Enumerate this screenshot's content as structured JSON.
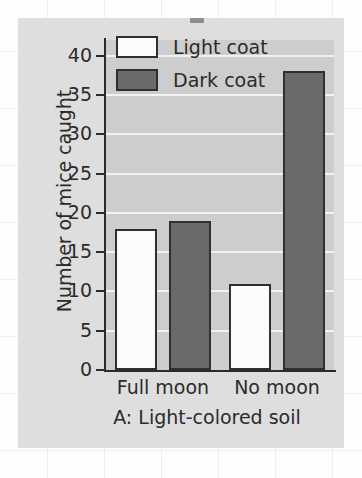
{
  "chart_data": {
    "type": "bar",
    "title": "",
    "subtitle": "",
    "caption": "A: Light-colored soil",
    "xlabel": "",
    "ylabel": "Number of mice caught",
    "categories": [
      "Full moon",
      "No moon"
    ],
    "series": [
      {
        "name": "Light coat",
        "values": [
          18,
          11
        ],
        "color": "#fbfbfb"
      },
      {
        "name": "Dark coat",
        "values": [
          19,
          38
        ],
        "color": "#6a6a6a"
      }
    ],
    "ylim": [
      0,
      42
    ],
    "yticks": [
      0,
      5,
      10,
      15,
      20,
      25,
      30,
      35,
      40
    ],
    "ytick_labels": [
      "0",
      "5",
      "10",
      "15",
      "20",
      "25",
      "30",
      "35",
      "40"
    ],
    "grid": "horizontal",
    "legend_position": "top-left-inside",
    "plot_background": "#cdcdcd",
    "gridline_color": "#f2f2f2",
    "axis_color": "#2b2b2b",
    "panel_background": "#dedede",
    "page_background": "#fdfdfd"
  },
  "legend": {
    "items": [
      {
        "label": "Light coat",
        "swatch": "light"
      },
      {
        "label": "Dark coat",
        "swatch": "dark"
      }
    ]
  }
}
